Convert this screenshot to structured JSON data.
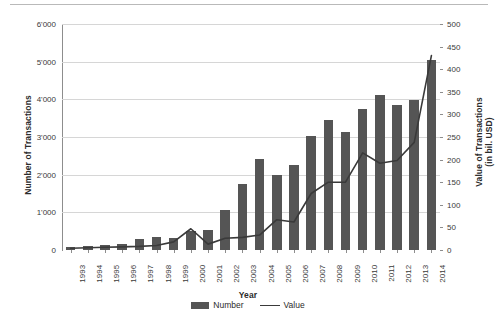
{
  "chart_data": {
    "type": "bar",
    "title": "",
    "xlabel": "Year",
    "ylabel": "Number of Transactions",
    "y2label": "Value of Transactions (in bil. USD)",
    "y2label_line1": "Value of Transactions",
    "y2label_line2": "(in bil. USD)",
    "categories": [
      "1993",
      "1994",
      "1995",
      "1996",
      "1997",
      "1998",
      "1999",
      "2000",
      "2001",
      "2002",
      "2003",
      "2004",
      "2005",
      "2006",
      "2007",
      "2008",
      "2009",
      "2010",
      "2011",
      "2012",
      "2013",
      "2014"
    ],
    "ylim": [
      0,
      6000
    ],
    "y2lim": [
      0,
      500
    ],
    "yticks": [
      0,
      1000,
      2000,
      3000,
      4000,
      5000,
      6000
    ],
    "ytick_labels": [
      "0",
      "1'000",
      "2'000",
      "3'000",
      "4'000",
      "5'000",
      "6'000"
    ],
    "y2ticks": [
      0,
      50,
      100,
      150,
      200,
      250,
      300,
      350,
      400,
      450,
      500
    ],
    "y2tick_labels": [
      "0",
      "50",
      "100",
      "150",
      "200",
      "250",
      "300",
      "350",
      "400",
      "450",
      "500"
    ],
    "grid": true,
    "legend_position": "bottom",
    "series": [
      {
        "name": "Number",
        "kind": "bar",
        "axis": "left",
        "color": "#555555",
        "values": [
          90,
          115,
          140,
          165,
          280,
          345,
          330,
          500,
          535,
          1050,
          1740,
          2420,
          1980,
          2250,
          3040,
          3450,
          3120,
          3750,
          4110,
          3840,
          3980,
          5050
        ]
      },
      {
        "name": "Value",
        "kind": "line",
        "axis": "right",
        "color": "#3a3a3a",
        "values": [
          4,
          5,
          6,
          7,
          8,
          10,
          18,
          47,
          13,
          26,
          28,
          33,
          67,
          62,
          125,
          150,
          150,
          215,
          192,
          198,
          238,
          430
        ]
      }
    ]
  },
  "legend": {
    "items": [
      {
        "label": "Number",
        "type": "bar-swatch"
      },
      {
        "label": "Value",
        "type": "line-swatch"
      }
    ]
  }
}
